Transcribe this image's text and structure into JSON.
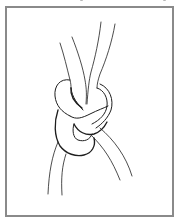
{
  "figure": {
    "style": "line drawing",
    "frame_color": "#8a8a8a",
    "stroke_color": "#1e1e1e",
    "background_color": "#ffffff"
  }
}
